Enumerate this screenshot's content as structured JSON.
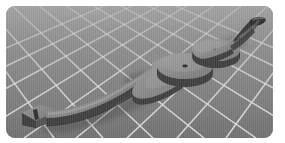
{
  "viewport": {
    "label": "3d-model-viewport",
    "background_color": "#8c8c8c",
    "grid_line_color": "#d6d6d6",
    "panel_radius_px": 9,
    "panel_rect": {
      "x": 6,
      "y": 6,
      "width": 267,
      "height": 132
    },
    "canvas_background": "#ffffff"
  },
  "scene": {
    "floor": {
      "name": "perspective-grid-floor",
      "type": "grid-plane",
      "color": "#8c8c8c",
      "line_color": "#d6d6d6",
      "perspective": "horizon-at-top"
    },
    "model": {
      "name": "curved-bow-limb",
      "description": "long curved blade-like body with three circular disc bosses and a blocky nock at the lower-left end and a hooked tip at the upper-right end",
      "top_face_color": "#8a8a8a",
      "side_wall_color": "#4b4b4b",
      "edge_color": "#3a3a3a",
      "highlight_color": "#b4b4b4",
      "shadow_color": "#5e5e5e",
      "orientation": "lower-left to upper-right diagonal",
      "features": [
        {
          "name": "nock-block",
          "kind": "block",
          "position": "lower-left"
        },
        {
          "name": "shaft",
          "kind": "ribbed-bar",
          "position": "lower-left-to-center"
        },
        {
          "name": "disc-1",
          "kind": "cylinder-boss",
          "position": "center-left",
          "has_center_hole": true
        },
        {
          "name": "disc-2",
          "kind": "cylinder-boss",
          "position": "center",
          "has_center_hole": true
        },
        {
          "name": "disc-3",
          "kind": "cylinder-boss",
          "position": "center-right",
          "has_center_hole": true
        },
        {
          "name": "hook-tip",
          "kind": "hook",
          "position": "upper-right"
        }
      ]
    }
  }
}
